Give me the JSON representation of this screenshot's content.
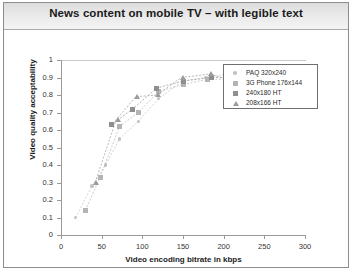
{
  "slide": {
    "title": "News content on mobile TV – with legible text"
  },
  "legend": {
    "items": [
      {
        "label": "PAQ 320x240",
        "marker": "diamond-marker",
        "color": "#c2c2c2"
      },
      {
        "label": "3G Phone 176x144",
        "marker": "square-marker",
        "color": "#b4b4b4"
      },
      {
        "label": "240x180 HT",
        "marker": "filled-square-marker",
        "color": "#8f8f8f"
      },
      {
        "label": "208x166 HT",
        "marker": "triangle-marker",
        "color": "#9b9b9b"
      }
    ]
  },
  "chart_data": {
    "type": "scatter",
    "title": "News content on mobile TV – with legible text",
    "xlabel": "Video encoding bitrate in kbps",
    "ylabel": "Video quality acceptability",
    "xlim": [
      0,
      300
    ],
    "ylim": [
      0,
      1
    ],
    "xticks": [
      0,
      50,
      100,
      150,
      200,
      250,
      300
    ],
    "yticks": [
      0,
      0.1,
      0.2,
      0.3,
      0.4,
      0.5,
      0.6,
      0.7,
      0.8,
      0.9,
      1
    ],
    "grid": false,
    "legend_position": "top-right",
    "series": [
      {
        "name": "PAQ 320x240",
        "marker": "diamond",
        "color": "#c2c2c2",
        "points": [
          {
            "x": 18,
            "y": 0.1
          },
          {
            "x": 38,
            "y": 0.28
          },
          {
            "x": 55,
            "y": 0.4
          },
          {
            "x": 72,
            "y": 0.55
          },
          {
            "x": 95,
            "y": 0.65
          },
          {
            "x": 120,
            "y": 0.78
          },
          {
            "x": 150,
            "y": 0.88
          },
          {
            "x": 178,
            "y": 0.9
          },
          {
            "x": 205,
            "y": 0.92
          },
          {
            "x": 232,
            "y": 0.9
          }
        ]
      },
      {
        "name": "3G Phone 176x144",
        "marker": "square",
        "color": "#b4b4b4",
        "points": [
          {
            "x": 30,
            "y": 0.14
          },
          {
            "x": 48,
            "y": 0.33
          },
          {
            "x": 72,
            "y": 0.62
          },
          {
            "x": 95,
            "y": 0.7
          },
          {
            "x": 120,
            "y": 0.82
          },
          {
            "x": 150,
            "y": 0.86
          },
          {
            "x": 180,
            "y": 0.89
          },
          {
            "x": 212,
            "y": 0.89
          }
        ]
      },
      {
        "name": "240x180 HT",
        "marker": "filled-square",
        "color": "#8f8f8f",
        "points": [
          {
            "x": 62,
            "y": 0.63
          },
          {
            "x": 88,
            "y": 0.72
          },
          {
            "x": 118,
            "y": 0.84
          },
          {
            "x": 150,
            "y": 0.88
          },
          {
            "x": 185,
            "y": 0.9
          },
          {
            "x": 215,
            "y": 0.9
          }
        ]
      },
      {
        "name": "208x166 HT",
        "marker": "triangle",
        "color": "#9b9b9b",
        "points": [
          {
            "x": 42,
            "y": 0.3
          },
          {
            "x": 68,
            "y": 0.66
          },
          {
            "x": 92,
            "y": 0.79
          },
          {
            "x": 118,
            "y": 0.8
          },
          {
            "x": 148,
            "y": 0.9
          },
          {
            "x": 183,
            "y": 0.92
          },
          {
            "x": 212,
            "y": 0.88
          }
        ]
      }
    ]
  }
}
